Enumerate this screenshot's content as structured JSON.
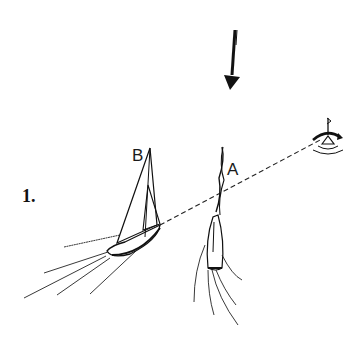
{
  "figure": {
    "number_label": "1.",
    "boat_a_label": "A",
    "boat_b_label": "B"
  },
  "elements": {
    "wind_arrow": "wind-direction-arrow",
    "buoy": "mark-buoy",
    "bearing_line": "dashed-line-of-sight"
  },
  "colors": {
    "ink": "#111111",
    "background": "#ffffff"
  }
}
